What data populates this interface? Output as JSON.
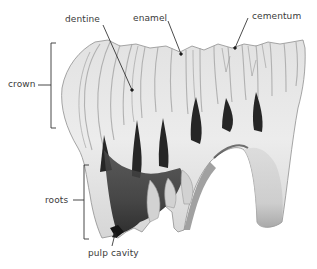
{
  "diagram": {
    "labels": {
      "dentine": "dentine",
      "enamel": "enamel",
      "cementum": "cementum",
      "crown": "crown",
      "roots": "roots",
      "pulp_cavity": "pulp cavity"
    },
    "colors": {
      "background": "#ffffff",
      "text": "#3a3a3a",
      "leader_line": "#222222",
      "tooth_light": "#e9e9e9",
      "tooth_mid": "#bdbdbd",
      "tooth_dark": "#2a2a2a"
    }
  }
}
